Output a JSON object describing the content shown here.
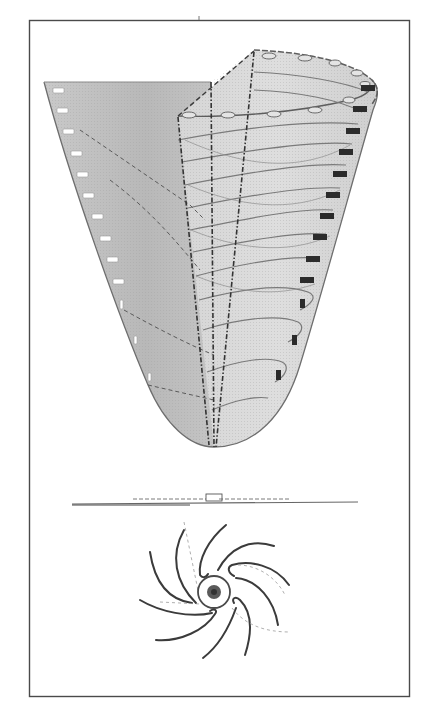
{
  "figure": {
    "text_labels": [],
    "colors": {
      "background": "#ffffff",
      "frame": "#4a4a4a",
      "cone_fill_dark": "#b9b9b9",
      "cone_fill_mid": "#cdcdcd",
      "cone_fill_light": "#dcdcdc",
      "line": "#6b6b6b",
      "dashed_axis": "#3a3a3a",
      "marker_dark": "#2b2b2b",
      "marker_light": "#ffffff",
      "spiral_arm": "#3b3b3b",
      "core": "#555555"
    },
    "frame": {
      "x": 29,
      "y": 20,
      "width": 381,
      "height": 677
    },
    "funnel": {
      "apex": [
        214,
        447
      ],
      "left_rim_top_y": 82,
      "left_markers_count": 12,
      "right_markers_count": 13,
      "lip_holes_count": 10,
      "streamline_count": 12
    },
    "surface_line": {
      "y": 503,
      "x_start": 72,
      "x_end": 358
    },
    "plan_view": {
      "center": [
        214,
        592
      ],
      "arms": 8,
      "core_radius": 6,
      "ring_radius": 17
    }
  }
}
